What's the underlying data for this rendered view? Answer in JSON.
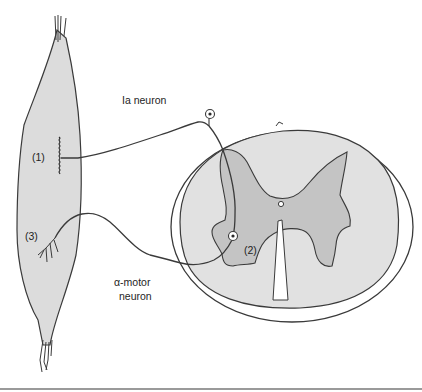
{
  "diagram": {
    "labels": {
      "ia_neuron": "Ia neuron",
      "alpha_motor_line1": "α-motor",
      "alpha_motor_line2": "neuron",
      "marker_1": "(1)",
      "marker_2": "(2)",
      "marker_3": "(3)"
    },
    "components": {
      "muscle": "muscle",
      "spinal_cord": "spinal cord cross-section",
      "gray_matter": "gray matter",
      "central_canal": "central canal",
      "ia_cell_body": "dorsal root ganglion cell body",
      "motor_cell_body": "motor neuron cell body"
    },
    "colors": {
      "muscle_fill": "#dcdcdc",
      "white_matter_fill": "#e1e1e1",
      "gray_matter_fill": "#c4c4c4",
      "line": "#3a3a3a",
      "text": "#1e1e1e",
      "bottom_rule": "#9a9a9a"
    }
  }
}
